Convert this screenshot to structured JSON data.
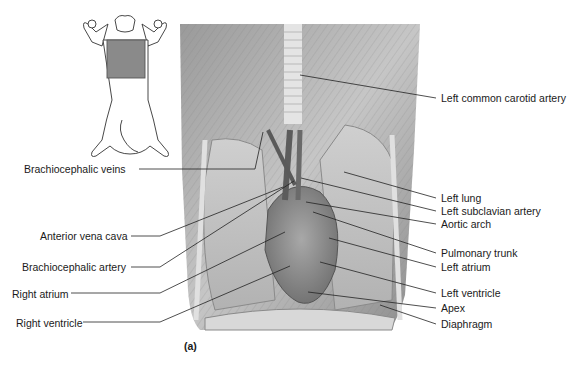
{
  "figure": {
    "panel_label": "(a)",
    "orientation_icon": "cat-ventral-view-icon",
    "left_labels": [
      {
        "text": "Brachiocephalic veins",
        "x": 24,
        "y": 163,
        "line": [
          [
            139,
            169
          ],
          [
            255,
            169
          ],
          [
            263,
            132
          ]
        ]
      },
      {
        "text": "Anterior vena cava",
        "x": 40,
        "y": 230,
        "line": [
          [
            131,
            236
          ],
          [
            160,
            236
          ],
          [
            283,
            187
          ]
        ]
      },
      {
        "text": "Brachiocephalic artery",
        "x": 22,
        "y": 261,
        "line": [
          [
            131,
            267
          ],
          [
            160,
            267
          ],
          [
            294,
            181
          ]
        ]
      },
      {
        "text": "Right atrium",
        "x": 12,
        "y": 288,
        "line": [
          [
            71,
            293
          ],
          [
            160,
            293
          ],
          [
            285,
            232
          ]
        ]
      },
      {
        "text": "Right ventricle",
        "x": 16,
        "y": 317,
        "line": [
          [
            83,
            322
          ],
          [
            160,
            322
          ],
          [
            290,
            266
          ]
        ]
      }
    ],
    "right_labels": [
      {
        "text": "Left common carotid artery",
        "x": 441,
        "y": 92,
        "line": [
          [
            300,
            75
          ],
          [
            436,
            98
          ]
        ]
      },
      {
        "text": "Left lung",
        "x": 441,
        "y": 192,
        "line": [
          [
            344,
            172
          ],
          [
            436,
            198
          ]
        ]
      },
      {
        "text": "Left subclavian artery",
        "x": 441,
        "y": 205,
        "line": [
          [
            301,
            178
          ],
          [
            436,
            211
          ]
        ]
      },
      {
        "text": "Aortic arch",
        "x": 441,
        "y": 218,
        "line": [
          [
            306,
            202
          ],
          [
            436,
            224
          ]
        ]
      },
      {
        "text": "Pulmonary trunk",
        "x": 441,
        "y": 247,
        "line": [
          [
            313,
            212
          ],
          [
            436,
            253
          ]
        ]
      },
      {
        "text": "Left atrium",
        "x": 441,
        "y": 261,
        "line": [
          [
            329,
            238
          ],
          [
            436,
            267
          ]
        ]
      },
      {
        "text": "Left ventricle",
        "x": 441,
        "y": 287,
        "line": [
          [
            320,
            262
          ],
          [
            436,
            293
          ]
        ]
      },
      {
        "text": "Apex",
        "x": 441,
        "y": 302,
        "line": [
          [
            308,
            292
          ],
          [
            436,
            308
          ]
        ]
      },
      {
        "text": "Diaphragm",
        "x": 441,
        "y": 318,
        "line": [
          [
            380,
            305
          ],
          [
            436,
            324
          ]
        ]
      }
    ]
  }
}
